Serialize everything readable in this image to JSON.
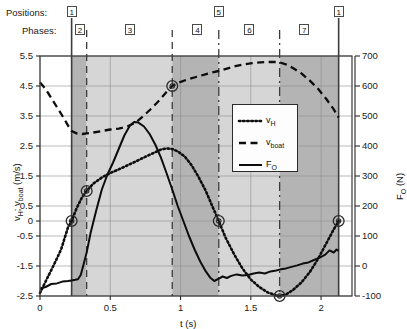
{
  "annotations": {
    "positions_label": "Positions:",
    "phases_label": "Phases:",
    "positions": [
      {
        "num": "1",
        "t": 0.225
      },
      {
        "num": "5",
        "t": 1.272
      },
      {
        "num": "1",
        "t": 2.125
      }
    ],
    "phases": [
      {
        "num": "2",
        "t_center": 0.285
      },
      {
        "num": "3",
        "t_center": 0.64
      },
      {
        "num": "4",
        "t_center": 1.12
      },
      {
        "num": "6",
        "t_center": 1.49
      },
      {
        "num": "7",
        "t_center": 1.88
      }
    ]
  },
  "chart_data": {
    "type": "line",
    "title": "",
    "xlabel": "t (s)",
    "ylabel": "v_H; v_boat (m/s)",
    "ylabel_right": "F_O (N)",
    "xlim": [
      0,
      2.22
    ],
    "ylim": [
      -2.5,
      5.5
    ],
    "ylim_right": [
      -100,
      700
    ],
    "xticks": [
      0,
      0.5,
      1,
      1.5,
      2
    ],
    "xticklabels": [
      "0",
      "0.5",
      "1",
      "1.5",
      "2"
    ],
    "yticks": [
      -2.5,
      -1.5,
      -0.5,
      0,
      0.5,
      1.5,
      2.5,
      3.5,
      4.5,
      5.5
    ],
    "yticklabels": [
      "-2.5",
      "-1.5",
      "-0.5",
      "0",
      "0.5",
      "1.5",
      "2.5",
      "3.5",
      "4.5",
      "5.5"
    ],
    "yticks_right": [
      -100,
      0,
      100,
      200,
      300,
      400,
      500,
      600,
      700
    ],
    "yticklabels_right": [
      "-100",
      "0",
      "100",
      "200",
      "300",
      "400",
      "500",
      "600",
      "700"
    ],
    "grid": true,
    "legend_position": "center-right",
    "legend": [
      {
        "name": "v_H",
        "display": "v",
        "sub": "H",
        "style": "dotted"
      },
      {
        "name": "v_boat",
        "display": "v",
        "sub": "boat",
        "style": "dashed"
      },
      {
        "name": "F_O",
        "display": "F",
        "sub": "O",
        "style": "solid"
      }
    ],
    "shaded_bands": [
      {
        "t0": 0.225,
        "t1": 0.332,
        "shade": "dark"
      },
      {
        "t0": 0.332,
        "t1": 0.941,
        "shade": "light"
      },
      {
        "t0": 0.941,
        "t1": 1.272,
        "shade": "dark"
      },
      {
        "t0": 1.272,
        "t1": 1.705,
        "shade": "light"
      },
      {
        "t0": 1.705,
        "t1": 2.125,
        "shade": "dark"
      }
    ],
    "vlines": [
      {
        "t": 0.225,
        "style": "solid"
      },
      {
        "t": 0.332,
        "style": "dashed"
      },
      {
        "t": 0.941,
        "style": "dashed"
      },
      {
        "t": 1.272,
        "style": "dashdot"
      },
      {
        "t": 1.705,
        "style": "dashdot"
      },
      {
        "t": 2.125,
        "style": "solid"
      }
    ],
    "markers": [
      {
        "t": 0.225,
        "v": 0.0
      },
      {
        "t": 0.332,
        "v": 1.0
      },
      {
        "t": 0.941,
        "v": 4.5
      },
      {
        "t": 1.272,
        "v": 0.0
      },
      {
        "t": 1.705,
        "v": -2.5
      },
      {
        "t": 2.125,
        "v": 0.0
      }
    ],
    "series": [
      {
        "name": "v_H",
        "axis": "left",
        "style": "dotted",
        "points": [
          [
            0.0,
            -2.4
          ],
          [
            0.05,
            -1.92
          ],
          [
            0.1,
            -1.45
          ],
          [
            0.15,
            -0.95
          ],
          [
            0.2,
            -0.2
          ],
          [
            0.225,
            0.0
          ],
          [
            0.26,
            0.42
          ],
          [
            0.3,
            0.8
          ],
          [
            0.332,
            1.0
          ],
          [
            0.38,
            1.25
          ],
          [
            0.44,
            1.45
          ],
          [
            0.5,
            1.6
          ],
          [
            0.56,
            1.72
          ],
          [
            0.62,
            1.85
          ],
          [
            0.68,
            1.98
          ],
          [
            0.74,
            2.12
          ],
          [
            0.8,
            2.25
          ],
          [
            0.86,
            2.38
          ],
          [
            0.9,
            2.42
          ],
          [
            0.941,
            2.4
          ],
          [
            0.98,
            2.32
          ],
          [
            1.03,
            2.15
          ],
          [
            1.08,
            1.85
          ],
          [
            1.13,
            1.45
          ],
          [
            1.18,
            1.0
          ],
          [
            1.23,
            0.45
          ],
          [
            1.272,
            0.0
          ],
          [
            1.32,
            -0.55
          ],
          [
            1.38,
            -1.1
          ],
          [
            1.44,
            -1.58
          ],
          [
            1.5,
            -1.95
          ],
          [
            1.56,
            -2.2
          ],
          [
            1.62,
            -2.38
          ],
          [
            1.68,
            -2.48
          ],
          [
            1.705,
            -2.5
          ],
          [
            1.75,
            -2.45
          ],
          [
            1.8,
            -2.3
          ],
          [
            1.86,
            -2.05
          ],
          [
            1.92,
            -1.7
          ],
          [
            1.98,
            -1.25
          ],
          [
            2.04,
            -0.72
          ],
          [
            2.09,
            -0.28
          ],
          [
            2.125,
            0.0
          ]
        ]
      },
      {
        "name": "v_boat",
        "axis": "left",
        "style": "dashed",
        "points": [
          [
            0.0,
            4.62
          ],
          [
            0.04,
            4.4
          ],
          [
            0.08,
            4.1
          ],
          [
            0.12,
            3.8
          ],
          [
            0.16,
            3.5
          ],
          [
            0.2,
            3.18
          ],
          [
            0.225,
            3.0
          ],
          [
            0.26,
            2.92
          ],
          [
            0.3,
            2.9
          ],
          [
            0.332,
            2.92
          ],
          [
            0.38,
            2.95
          ],
          [
            0.44,
            3.0
          ],
          [
            0.5,
            3.05
          ],
          [
            0.56,
            3.08
          ],
          [
            0.62,
            3.15
          ],
          [
            0.68,
            3.28
          ],
          [
            0.74,
            3.52
          ],
          [
            0.8,
            3.78
          ],
          [
            0.86,
            4.08
          ],
          [
            0.9,
            4.3
          ],
          [
            0.941,
            4.5
          ],
          [
            0.99,
            4.62
          ],
          [
            1.05,
            4.72
          ],
          [
            1.11,
            4.8
          ],
          [
            1.17,
            4.88
          ],
          [
            1.22,
            4.95
          ],
          [
            1.272,
            5.0
          ],
          [
            1.33,
            5.08
          ],
          [
            1.39,
            5.16
          ],
          [
            1.45,
            5.22
          ],
          [
            1.51,
            5.26
          ],
          [
            1.57,
            5.29
          ],
          [
            1.63,
            5.3
          ],
          [
            1.68,
            5.3
          ],
          [
            1.705,
            5.29
          ],
          [
            1.75,
            5.22
          ],
          [
            1.8,
            5.1
          ],
          [
            1.86,
            4.92
          ],
          [
            1.92,
            4.68
          ],
          [
            1.98,
            4.4
          ],
          [
            2.04,
            4.05
          ],
          [
            2.09,
            3.72
          ],
          [
            2.125,
            3.45
          ]
        ]
      },
      {
        "name": "F_O",
        "axis": "right",
        "style": "solid",
        "points": [
          [
            0.0,
            -75
          ],
          [
            0.04,
            -70
          ],
          [
            0.08,
            -60
          ],
          [
            0.12,
            -58
          ],
          [
            0.16,
            -52
          ],
          [
            0.2,
            -50
          ],
          [
            0.225,
            -48
          ],
          [
            0.25,
            -46
          ],
          [
            0.27,
            -44
          ],
          [
            0.29,
            -30
          ],
          [
            0.31,
            5
          ],
          [
            0.332,
            45
          ],
          [
            0.36,
            110
          ],
          [
            0.4,
            185
          ],
          [
            0.44,
            255
          ],
          [
            0.48,
            305
          ],
          [
            0.52,
            345
          ],
          [
            0.56,
            390
          ],
          [
            0.6,
            435
          ],
          [
            0.64,
            468
          ],
          [
            0.67,
            480
          ],
          [
            0.7,
            478
          ],
          [
            0.74,
            465
          ],
          [
            0.78,
            440
          ],
          [
            0.82,
            405
          ],
          [
            0.86,
            362
          ],
          [
            0.9,
            310
          ],
          [
            0.941,
            255
          ],
          [
            0.98,
            200
          ],
          [
            1.02,
            150
          ],
          [
            1.06,
            100
          ],
          [
            1.1,
            55
          ],
          [
            1.14,
            15
          ],
          [
            1.18,
            -18
          ],
          [
            1.21,
            -38
          ],
          [
            1.24,
            -50
          ],
          [
            1.272,
            -42
          ],
          [
            1.3,
            -35
          ],
          [
            1.33,
            -40
          ],
          [
            1.36,
            -33
          ],
          [
            1.4,
            -28
          ],
          [
            1.44,
            -32
          ],
          [
            1.48,
            -30
          ],
          [
            1.52,
            -25
          ],
          [
            1.56,
            -22
          ],
          [
            1.6,
            -25
          ],
          [
            1.64,
            -18
          ],
          [
            1.68,
            -15
          ],
          [
            1.705,
            -12
          ],
          [
            1.75,
            -8
          ],
          [
            1.79,
            -3
          ],
          [
            1.83,
            2
          ],
          [
            1.87,
            8
          ],
          [
            1.91,
            12
          ],
          [
            1.95,
            20
          ],
          [
            1.99,
            28
          ],
          [
            2.03,
            38
          ],
          [
            2.06,
            52
          ],
          [
            2.09,
            45
          ],
          [
            2.11,
            55
          ],
          [
            2.125,
            50
          ]
        ]
      }
    ]
  }
}
